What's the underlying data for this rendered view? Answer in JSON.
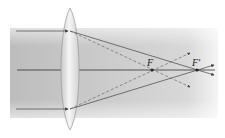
{
  "diagram": {
    "type": "optics-converging-lens",
    "labels": {
      "focus_1": "F",
      "focus_2": "F′"
    },
    "colors": {
      "beam_band": "#c8c8c8",
      "lens": "#e8e8e8",
      "lens_edge": "#9a9a9a",
      "ray": "#444444",
      "axis": "#333333",
      "dot": "#222222"
    },
    "geometry": {
      "lens_center_x": 70,
      "axis_y": 70,
      "focus_1_x": 152,
      "focus_2_x": 197,
      "ray_top_y": 31,
      "ray_bottom_y": 109
    }
  }
}
